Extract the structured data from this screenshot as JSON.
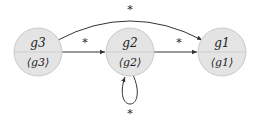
{
  "colors": {
    "node_fill": "#e4e4e4",
    "node_stroke": "#c9c9c9",
    "divider": "#cfcfcf",
    "edge": "#333333"
  },
  "nodes": [
    {
      "id": "g3",
      "top": "g3",
      "bottom": "⟨g3⟩"
    },
    {
      "id": "g2",
      "top": "g2",
      "bottom": "⟨g2⟩"
    },
    {
      "id": "g1",
      "top": "g1",
      "bottom": "⟨g1⟩"
    }
  ],
  "edges": [
    {
      "from": "g3",
      "to": "g2",
      "label": "*"
    },
    {
      "from": "g2",
      "to": "g1",
      "label": "*"
    },
    {
      "from": "g3",
      "to": "g1",
      "label": "*"
    },
    {
      "from": "g2",
      "to": "g2",
      "label": "*"
    }
  ]
}
